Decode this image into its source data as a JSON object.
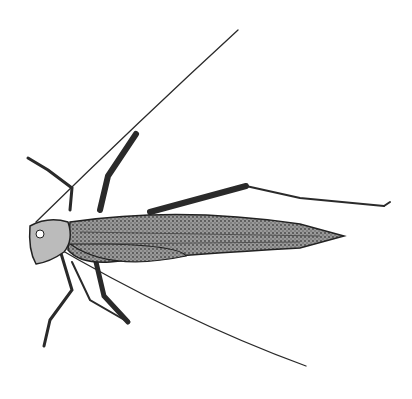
{
  "image": {
    "subject": "pencil sketch of a grasshopper",
    "background": "#ffffff",
    "stroke_color": "#2a2a2a",
    "fill_color": "#8a8a8a"
  }
}
